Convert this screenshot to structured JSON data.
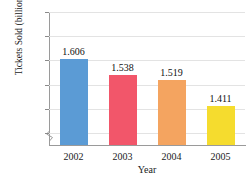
{
  "chart_data": {
    "type": "bar",
    "title": "",
    "xlabel": "Year",
    "ylabel": "Tickets Sold (billions)",
    "categories": [
      "2002",
      "2003",
      "2004",
      "2005"
    ],
    "values": [
      1.606,
      1.538,
      1.519,
      1.411
    ],
    "value_labels": [
      "1.606",
      "1.538",
      "1.519",
      "1.411"
    ],
    "ylim": [
      1.25,
      1.8
    ],
    "yticks": [
      1.3,
      1.4,
      1.5,
      1.6,
      1.7,
      1.8
    ],
    "ytick_labels": [
      "1.3",
      "1.4",
      "1.5",
      "1.6",
      "1.7",
      "1.8"
    ],
    "grid": true,
    "legend": false,
    "axis_break": true,
    "bar_colors": [
      "#5b9bd5",
      "#f2566a",
      "#f4a460",
      "#f5dc2e"
    ],
    "axis_color": "#9a9a9a",
    "grid_color": "#e3e3e3"
  }
}
